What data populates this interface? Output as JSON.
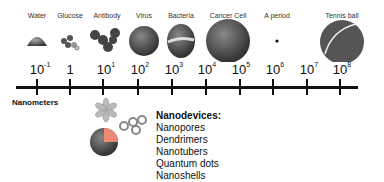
{
  "scale": {
    "unit_label": "Nanometers",
    "ticks": [
      {
        "base": "10",
        "exp": "-1"
      },
      {
        "base": "1",
        "exp": ""
      },
      {
        "base": "10",
        "exp": "1"
      },
      {
        "base": "10",
        "exp": "2"
      },
      {
        "base": "10",
        "exp": "3"
      },
      {
        "base": "10",
        "exp": "4"
      },
      {
        "base": "10",
        "exp": "5"
      },
      {
        "base": "10",
        "exp": "6"
      },
      {
        "base": "10",
        "exp": "7"
      },
      {
        "base": "10",
        "exp": "8"
      }
    ]
  },
  "objects": [
    {
      "label": "Water"
    },
    {
      "label": "Glucose"
    },
    {
      "label": "Antibody"
    },
    {
      "label": "Virus"
    },
    {
      "label": "Bacteria"
    },
    {
      "label": "Cancer Cell"
    },
    {
      "label": "A period"
    },
    {
      "label": "Tennis ball"
    }
  ],
  "nanodevices": {
    "title": "Nanodevices:",
    "items": [
      "Nanopores",
      "Dendrimers",
      "Nanotubers",
      "Quantum dots",
      "Nanoshells"
    ]
  }
}
